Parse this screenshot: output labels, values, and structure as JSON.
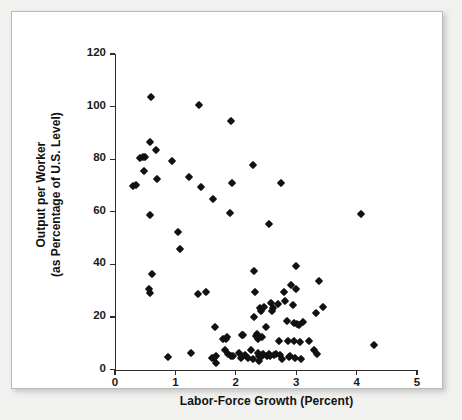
{
  "figure": {
    "background_color": "#f1f1ef",
    "panel_color": "#ffffff",
    "marker_color": "#111111",
    "axis_color": "#2b2b2b"
  },
  "chart_data": {
    "type": "scatter",
    "title": "",
    "xlabel": "Labor-Force Growth (Percent)",
    "ylabel_line1": "Output per Worker",
    "ylabel_line2": "(as Percentage of U.S. Level)",
    "xlim": [
      0,
      5
    ],
    "ylim": [
      0,
      120
    ],
    "xticks": [
      0,
      1,
      2,
      3,
      4,
      5
    ],
    "xtick_labels": [
      "0",
      "1",
      "2",
      "3",
      "4",
      "5"
    ],
    "yticks": [
      0,
      20,
      40,
      60,
      80,
      100,
      120
    ],
    "ytick_labels": [
      "0",
      "20",
      "40",
      "60",
      "80",
      "100",
      "120"
    ],
    "grid": false,
    "legend": null,
    "marker": "diamond",
    "series": [
      {
        "name": "Countries",
        "points": [
          [
            0.3,
            70.0
          ],
          [
            0.35,
            70.2
          ],
          [
            0.42,
            80.3
          ],
          [
            0.47,
            80.9
          ],
          [
            0.5,
            80.9
          ],
          [
            0.48,
            75.6
          ],
          [
            0.58,
            86.7
          ],
          [
            0.6,
            103.8
          ],
          [
            0.58,
            58.6
          ],
          [
            0.57,
            30.5
          ],
          [
            0.58,
            29.0
          ],
          [
            0.62,
            36.2
          ],
          [
            0.68,
            83.6
          ],
          [
            0.7,
            72.6
          ],
          [
            0.95,
            79.4
          ],
          [
            1.05,
            52.4
          ],
          [
            1.08,
            46.0
          ],
          [
            1.22,
            73.2
          ],
          [
            1.39,
            100.6
          ],
          [
            1.38,
            28.8
          ],
          [
            1.42,
            69.5
          ],
          [
            1.5,
            29.5
          ],
          [
            1.63,
            64.9
          ],
          [
            1.65,
            16.3
          ],
          [
            1.92,
            94.6
          ],
          [
            1.93,
            71.0
          ],
          [
            1.9,
            59.7
          ],
          [
            2.28,
            77.9
          ],
          [
            2.3,
            37.5
          ],
          [
            2.32,
            29.5
          ],
          [
            2.55,
            55.4
          ],
          [
            2.75,
            71.0
          ],
          [
            3.0,
            39.4
          ],
          [
            3.38,
            33.6
          ],
          [
            3.32,
            21.7
          ],
          [
            3.45,
            23.9
          ],
          [
            4.07,
            59.0
          ],
          [
            4.28,
            9.3
          ],
          [
            0.88,
            4.7
          ],
          [
            1.26,
            6.5
          ],
          [
            1.6,
            4.5
          ],
          [
            1.64,
            4.6
          ],
          [
            1.67,
            5.2
          ],
          [
            1.67,
            2.6
          ],
          [
            1.78,
            11.7
          ],
          [
            1.82,
            7.3
          ],
          [
            1.84,
            11.8
          ],
          [
            1.86,
            12.4
          ],
          [
            1.87,
            5.8
          ],
          [
            1.92,
            5.3
          ],
          [
            1.96,
            5.2
          ],
          [
            2.05,
            6.2
          ],
          [
            2.08,
            4.3
          ],
          [
            2.1,
            13.2
          ],
          [
            2.12,
            13.3
          ],
          [
            2.16,
            5.4
          ],
          [
            2.2,
            4.4
          ],
          [
            2.25,
            7.3
          ],
          [
            2.28,
            4.2
          ],
          [
            2.3,
            19.9
          ],
          [
            2.33,
            12.9
          ],
          [
            2.35,
            13.6
          ],
          [
            2.36,
            11.8
          ],
          [
            2.36,
            6.2
          ],
          [
            2.38,
            5.0
          ],
          [
            2.38,
            3.1
          ],
          [
            2.4,
            23.5
          ],
          [
            2.42,
            22.3
          ],
          [
            2.43,
            12.4
          ],
          [
            2.44,
            5.2
          ],
          [
            2.45,
            5.8
          ],
          [
            2.47,
            23.8
          ],
          [
            2.5,
            16.2
          ],
          [
            2.52,
            5.2
          ],
          [
            2.55,
            6.0
          ],
          [
            2.56,
            5.3
          ],
          [
            2.58,
            25.3
          ],
          [
            2.6,
            22.2
          ],
          [
            2.62,
            23.3
          ],
          [
            2.63,
            5.5
          ],
          [
            2.66,
            6.1
          ],
          [
            2.7,
            24.8
          ],
          [
            2.72,
            11.0
          ],
          [
            2.74,
            5.5
          ],
          [
            2.76,
            4.1
          ],
          [
            2.8,
            29.6
          ],
          [
            2.82,
            26.0
          ],
          [
            2.84,
            18.4
          ],
          [
            2.86,
            10.8
          ],
          [
            2.88,
            4.7
          ],
          [
            2.9,
            5.1
          ],
          [
            2.92,
            32.0
          ],
          [
            2.94,
            24.5
          ],
          [
            2.96,
            17.6
          ],
          [
            2.97,
            11.0
          ],
          [
            2.98,
            4.6
          ],
          [
            3.0,
            30.7
          ],
          [
            3.02,
            17.2
          ],
          [
            3.04,
            16.8
          ],
          [
            3.06,
            10.4
          ],
          [
            3.08,
            4.1
          ],
          [
            3.12,
            18.2
          ],
          [
            3.22,
            10.8
          ],
          [
            3.3,
            7.3
          ],
          [
            3.35,
            6.0
          ]
        ]
      }
    ]
  }
}
